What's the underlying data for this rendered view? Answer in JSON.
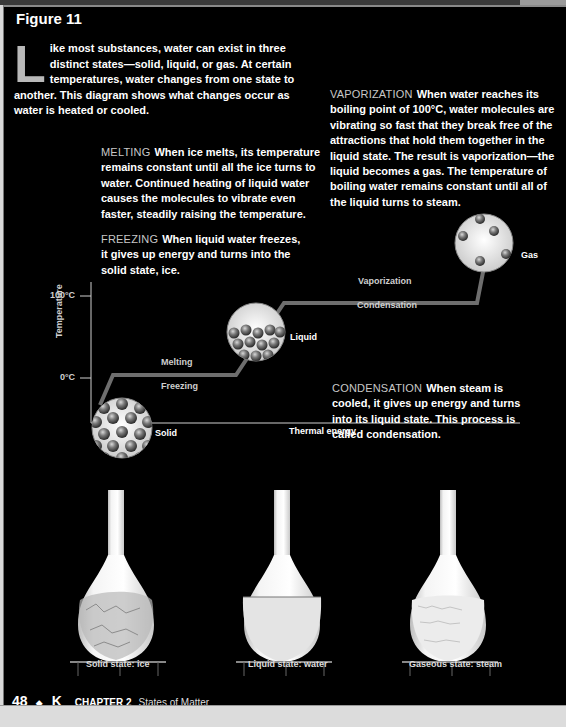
{
  "figure": {
    "title": "Figure 11",
    "intro": {
      "dropcap": "L",
      "text": "ike most substances, water can exist in three distinct states—solid, liquid, or gas. At certain temperatures, water changes from one state to another. This diagram shows what changes occur as water is heated or cooled."
    },
    "callouts": {
      "vaporization": {
        "lead": "VAPORIZATION",
        "text": "When water reaches its boiling point of 100°C, water molecules are vibrating so fast that they break free of the attractions that hold them together in the liquid state. The result is vaporization—the liquid becomes a gas. The temperature of boiling water remains constant until all of the liquid turns to steam."
      },
      "melting": {
        "lead": "MELTING",
        "text": "When ice melts, its temperature remains constant until all the ice turns to water. Continued heating of liquid water causes the molecules to vibrate even faster, steadily raising the temperature."
      },
      "freezing": {
        "lead": "FREEZING",
        "text": "When liquid water freezes, it gives up energy and turns into the solid state, ice."
      },
      "condensation": {
        "lead": "CONDENSATION",
        "text": "When steam is cooled, it gives up energy and turns into its liquid state. This process is called condensation."
      }
    },
    "diagram": {
      "y_axis_label": "Temperature",
      "x_axis_label": "Thermal energy",
      "y_ticks": [
        "100°C",
        "0°C"
      ],
      "curve_labels": {
        "melting": "Melting",
        "freezing": "Freezing",
        "vaporization": "Vaporization",
        "condensation": "Condensation"
      },
      "states": {
        "solid": "Solid",
        "liquid": "Liquid",
        "gas": "Gas"
      }
    },
    "photos": [
      {
        "caption": "Solid state: ice"
      },
      {
        "caption": "Liquid state: water"
      },
      {
        "caption": "Gaseous state: steam"
      }
    ]
  },
  "footer": {
    "page_number": "48",
    "bullet": "◆",
    "book_letter": "K",
    "chapter": "CHAPTER 2",
    "chapter_title": "States of Matter"
  }
}
